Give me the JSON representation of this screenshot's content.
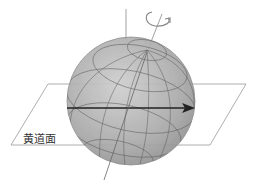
{
  "diagram": {
    "type": "celestial-sphere",
    "elements": [
      {
        "name": "sphere",
        "description": "shaded globe with latitude/longitude grid"
      },
      {
        "name": "rotation-axis",
        "description": "tilted rotation axis through sphere"
      },
      {
        "name": "rotation-arrow",
        "description": "curved arrow indicating rotation around axis"
      },
      {
        "name": "vertical-reference-line",
        "description": "vertical line perpendicular to ecliptic"
      },
      {
        "name": "ecliptic-plane",
        "description": "parallelogram plane"
      },
      {
        "name": "direction-arrow",
        "description": "horizontal arrow in ecliptic plane"
      }
    ],
    "plane_label": "黄道面",
    "colors": {
      "sphere_light": "#c8c8c8",
      "sphere_dark": "#8a8a8a",
      "grid": "#555555",
      "line": "#777777",
      "arrow": "#222222"
    }
  }
}
